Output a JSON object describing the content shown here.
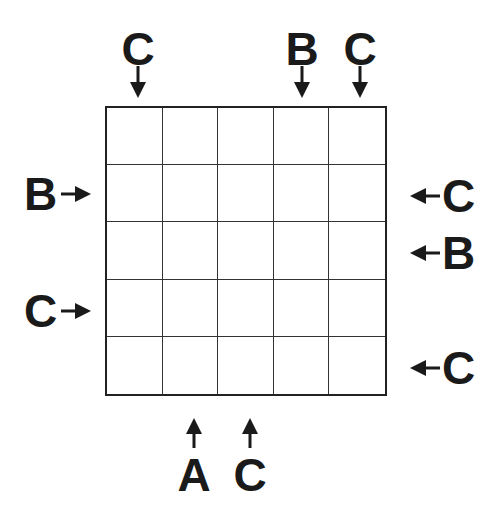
{
  "puzzle": {
    "type": "Easy as ABC",
    "size": 5,
    "letters": [
      "A",
      "B",
      "C"
    ],
    "grid": [
      [
        "",
        "",
        "",
        "",
        ""
      ],
      [
        "",
        "",
        "",
        "",
        ""
      ],
      [
        "",
        "",
        "",
        "",
        ""
      ],
      [
        "",
        "",
        "",
        "",
        ""
      ],
      [
        "",
        "",
        "",
        "",
        ""
      ]
    ],
    "clues": {
      "top": [
        "C",
        "",
        "",
        "B",
        "C"
      ],
      "bottom": [
        "",
        "A",
        "C",
        "",
        ""
      ],
      "left": [
        "",
        "B",
        "",
        "C",
        ""
      ],
      "right": [
        "",
        "C",
        "B",
        "",
        "C"
      ]
    }
  }
}
